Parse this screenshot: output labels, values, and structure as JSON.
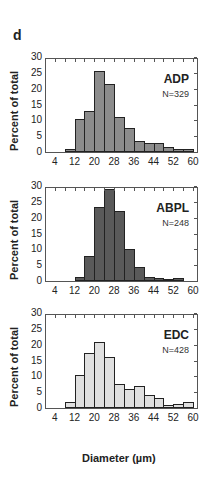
{
  "panel_letter": "d",
  "chart_data": [
    {
      "type": "bar",
      "title": "ADP",
      "annotation": "N=329",
      "xlabel": "",
      "ylabel": "Percent of total",
      "ylim": [
        0,
        30
      ],
      "xlim": [
        0,
        62
      ],
      "yticks": [
        0,
        5,
        10,
        15,
        20,
        25,
        30
      ],
      "xticks": [
        4,
        12,
        20,
        28,
        36,
        44,
        52,
        60
      ],
      "bin_edges": [
        8,
        12,
        16,
        20,
        24,
        28,
        32,
        36,
        40,
        44,
        48,
        52,
        56,
        60
      ],
      "values": [
        1,
        10.5,
        13,
        25.5,
        21.5,
        11,
        7.5,
        3.5,
        2.8,
        3,
        1.5,
        0.8,
        1.1
      ],
      "color": "#8c8c8c"
    },
    {
      "type": "bar",
      "title": "ABPL",
      "annotation": "N=248",
      "xlabel": "",
      "ylabel": "Percent of total",
      "ylim": [
        0,
        30
      ],
      "xlim": [
        0,
        62
      ],
      "yticks": [
        0,
        5,
        10,
        15,
        20,
        25,
        30
      ],
      "xticks": [
        4,
        12,
        20,
        28,
        36,
        44,
        52,
        60
      ],
      "bin_edges": [
        8,
        12,
        16,
        20,
        24,
        28,
        32,
        36,
        40,
        44,
        48,
        52,
        56,
        60
      ],
      "values": [
        0,
        1.2,
        8,
        23.5,
        29,
        22,
        10,
        4.5,
        1.2,
        0.8,
        0.4,
        0.9,
        0
      ],
      "color": "#5a5a5a"
    },
    {
      "type": "bar",
      "title": "EDC",
      "annotation": "N=428",
      "xlabel": "Diameter (µm)",
      "ylabel": "Percent of total",
      "ylim": [
        0,
        30
      ],
      "xlim": [
        0,
        62
      ],
      "yticks": [
        0,
        5,
        10,
        15,
        20,
        25,
        30
      ],
      "xticks": [
        4,
        12,
        20,
        28,
        36,
        44,
        52,
        60
      ],
      "bin_edges": [
        8,
        12,
        16,
        20,
        24,
        28,
        32,
        36,
        40,
        44,
        48,
        52,
        56,
        60
      ],
      "values": [
        2,
        10.5,
        17.5,
        21,
        16,
        7.5,
        6,
        7,
        4,
        3.3,
        1,
        1.4,
        2
      ],
      "color": "#e0e0e0"
    }
  ],
  "xlabel": "Diameter (µm)"
}
